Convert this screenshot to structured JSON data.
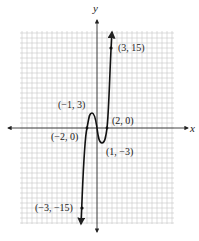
{
  "chart_data": {
    "type": "line",
    "title": "",
    "xlabel": "x",
    "ylabel": "y",
    "grid": true,
    "function_description": "polynomial curve through labeled points",
    "xlim": [
      -15,
      15
    ],
    "ylim": [
      -18,
      18
    ],
    "series": [
      {
        "name": "f(x)",
        "x": [
          -3,
          -2,
          -1,
          0,
          1,
          2,
          3
        ],
        "y": [
          -15,
          0,
          3,
          0,
          -3,
          0,
          15
        ]
      }
    ],
    "annotations": [
      {
        "label": "(3, 15)",
        "x": 3,
        "y": 15
      },
      {
        "label": "(−1, 3)",
        "x": -1,
        "y": 3
      },
      {
        "label": "(2, 0)",
        "x": 2,
        "y": 0
      },
      {
        "label": "(−2, 0)",
        "x": -2,
        "y": 0
      },
      {
        "label": "(1, −3)",
        "x": 1,
        "y": -3
      },
      {
        "label": "(−3, −15)",
        "x": -3,
        "y": -15
      }
    ]
  },
  "labels": {
    "x_axis": "x",
    "y_axis": "y",
    "p_3_15": "(3, 15)",
    "p_m1_3": "(−1, 3)",
    "p_2_0": "(2, 0)",
    "p_m2_0": "(−2, 0)",
    "p_1_m3": "(1, −3)",
    "p_m3_m15": "(−3, −15)"
  },
  "colors": {
    "grid": "#c8c8c8",
    "axis": "#333333",
    "curve": "#111111"
  }
}
